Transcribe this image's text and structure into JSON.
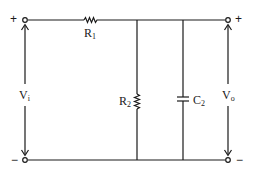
{
  "diagram": {
    "type": "circuit-schematic",
    "colors": {
      "line": "#1a1a1a",
      "background": "#ffffff"
    },
    "input": {
      "name": "V",
      "subscript": "i",
      "plus_sign": "+",
      "minus_sign": "−"
    },
    "output": {
      "name": "V",
      "subscript": "o",
      "plus_sign": "+",
      "minus_sign": "−"
    },
    "components": [
      {
        "id": "R1",
        "kind": "resistor",
        "placement": "series-top",
        "name": "R",
        "subscript": "1"
      },
      {
        "id": "R2",
        "kind": "resistor",
        "placement": "shunt",
        "name": "R",
        "subscript": "2"
      },
      {
        "id": "C2",
        "kind": "capacitor",
        "placement": "shunt",
        "name": "C",
        "subscript": "2"
      }
    ]
  }
}
